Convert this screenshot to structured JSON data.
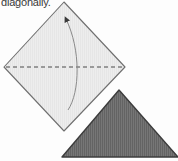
{
  "page": {
    "background_color": "#fdfdfd",
    "width": 178,
    "height": 161
  },
  "caption": {
    "text": "diagonally.",
    "color": "#3a3a3a",
    "clipped_at_top": true
  },
  "figure": {
    "type": "origami-fold-instruction",
    "shapes": [
      {
        "name": "paper-diamond",
        "label": "square sheet rotated 45 degrees",
        "fill_color": "#ececec",
        "stroke_color": "#6f6f6f",
        "vertices": [
          {
            "x": 64,
            "y": 2
          },
          {
            "x": 125,
            "y": 67
          },
          {
            "x": 64,
            "y": 131
          },
          {
            "x": 4,
            "y": 67
          }
        ]
      },
      {
        "name": "fold-crease-line",
        "label": "horizontal dashed crease",
        "style": "dashed",
        "stroke_color": "#4a4a4a",
        "from": {
          "x": 6,
          "y": 67
        },
        "to": {
          "x": 123,
          "y": 67
        }
      },
      {
        "name": "fold-direction-arrow",
        "label": "curved arrow showing fold motion",
        "stroke_color": "#777777",
        "arrowhead_at": {
          "x": 66,
          "y": 17
        },
        "path_from": {
          "x": 68,
          "y": 110
        },
        "path_to": {
          "x": 66,
          "y": 17
        }
      },
      {
        "name": "folded-triangle",
        "label": "resulting folded triangle",
        "fill_color": "#6e6e6e",
        "stroke_color": "#3c3c3c",
        "texture": "vertical-lines",
        "vertices": [
          {
            "x": 119,
            "y": 90
          },
          {
            "x": 178,
            "y": 157
          },
          {
            "x": 62,
            "y": 157
          }
        ]
      }
    ]
  }
}
